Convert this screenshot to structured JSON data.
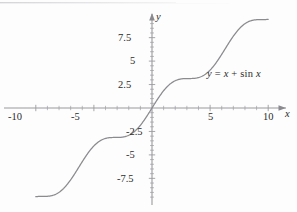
{
  "figure": {
    "name": "graph-of-y-equals-x-plus-sin-x",
    "background_color": "#fdfdfd",
    "curve_color": "#8a8a8f",
    "axis_color": "#9a9a9f",
    "text_color": "#2b2b2b"
  },
  "annotation": {
    "equation_y": "y",
    "equation_eq": "=",
    "equation_x": "x",
    "equation_plus": "+",
    "equation_sin": "sin",
    "equation_x2": "x",
    "equation_full": "y = x + sin x"
  },
  "axes": {
    "x_axis_name": "x",
    "y_axis_name": "y",
    "x_tick_labels": [
      "-10",
      "-5",
      "5",
      "10"
    ],
    "y_tick_labels": [
      "7.5",
      "5",
      "2.5",
      "-2.5",
      "-5",
      "-7.5"
    ]
  },
  "chart_data": {
    "type": "line",
    "title": "",
    "subtitle": "",
    "xlabel": "x",
    "ylabel": "y",
    "function": "y = x + sin x",
    "xlim": [
      -10.4,
      10.4
    ],
    "ylim": [
      -10.6,
      9.9
    ],
    "xticks": [
      -10,
      -9,
      -8,
      -7,
      -6,
      -5,
      -4,
      -3,
      -2,
      -1,
      0,
      1,
      2,
      3,
      4,
      5,
      6,
      7,
      8,
      9,
      10
    ],
    "xticklabels": [
      "-10",
      "",
      "",
      "",
      "",
      "-5",
      "",
      "",
      "",
      "",
      "",
      "",
      "",
      "",
      "",
      "5",
      "",
      "",
      "",
      "",
      "10"
    ],
    "yticks": [
      -9.5,
      -9,
      -8.5,
      -8,
      -7.5,
      -7,
      -6.5,
      -6,
      -5.5,
      -5,
      -4.5,
      -4,
      -3.5,
      -3,
      -2.5,
      -2,
      -1.5,
      -1,
      -0.5,
      0,
      0.5,
      1,
      1.5,
      2,
      2.5,
      3,
      3.5,
      4,
      4.5,
      5,
      5.5,
      6,
      6.5,
      7,
      7.5,
      8,
      8.5,
      9
    ],
    "yticklabels_major": [
      "7.5",
      "5",
      "2.5",
      "-2.5",
      "-5",
      "-7.5"
    ],
    "grid": false,
    "legend": false,
    "legend_position": "none",
    "annotations": [
      {
        "text": "y = x + sin x",
        "x": 6.2,
        "y": 3.9
      }
    ],
    "series": [
      {
        "name": "y = x + sin x",
        "color": "#8a8a8f",
        "x": [
          -10,
          -9.75,
          -9.5,
          -9.25,
          -9,
          -8.75,
          -8.5,
          -8.25,
          -8,
          -7.75,
          -7.5,
          -7.25,
          -7,
          -6.75,
          -6.5,
          -6.25,
          -6,
          -5.75,
          -5.5,
          -5.25,
          -5,
          -4.75,
          -4.5,
          -4.25,
          -4,
          -3.75,
          -3.5,
          -3.25,
          -3,
          -2.75,
          -2.5,
          -2.25,
          -2,
          -1.75,
          -1.5,
          -1.25,
          -1,
          -0.75,
          -0.5,
          -0.25,
          0,
          0.25,
          0.5,
          0.75,
          1,
          1.25,
          1.5,
          1.75,
          2,
          2.25,
          2.5,
          2.75,
          3,
          3.25,
          3.5,
          3.75,
          4,
          4.25,
          4.5,
          4.75,
          5,
          5.25,
          5.5,
          5.75,
          6,
          6.25,
          6.5,
          6.75,
          7,
          7.25,
          7.5,
          7.75,
          8,
          8.25,
          8.5,
          8.75,
          9,
          9.25,
          9.5,
          9.75,
          10
        ],
        "y": [
          -9.456,
          -9.38,
          -9.425,
          -9.58,
          -9.412,
          -9.13,
          -8.702,
          -8.19,
          -7.011,
          -7.75,
          -8.063,
          -8.06,
          -7.657,
          -7.306,
          -6.785,
          -6.25,
          -6.279,
          -5.26,
          -4.795,
          -4.39,
          -4.041,
          -3.75,
          -3.522,
          -3.356,
          -3.243,
          -3.178,
          -3.149,
          -3.142,
          -3.141,
          -3.131,
          -3.099,
          -3.028,
          -2.909,
          -2.766,
          -2.503,
          -2.301,
          -1.159,
          -1.432,
          -0.979,
          -0.503,
          0,
          0.497,
          0.979,
          1.432,
          1.841,
          2.199,
          2.497,
          2.734,
          2.909,
          3.028,
          3.099,
          3.131,
          3.141,
          3.142,
          3.149,
          3.178,
          3.243,
          3.356,
          3.522,
          3.75,
          4.041,
          4.39,
          4.795,
          5.26,
          5.721,
          6.25,
          6.785,
          7.306,
          7.657,
          8.06,
          8.063,
          8.75,
          9.011,
          9.19,
          9.302,
          9.13,
          9.412,
          9.58,
          9.425,
          9.38,
          9.456
        ],
        "note": "y = x + sin x evaluated on [-10, 10]"
      }
    ]
  }
}
